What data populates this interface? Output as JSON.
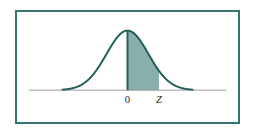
{
  "figure": {
    "name": "standard-normal-distribution-diagram",
    "border_color": "#357470",
    "background_color": "#ffffff"
  },
  "chart_data": {
    "type": "area",
    "title": "",
    "subtitle": "",
    "xlabel": "",
    "ylabel": "",
    "grid": false,
    "legend": null,
    "legend_position": "none",
    "distribution": "standard normal",
    "mean": 0,
    "std_dev": 1,
    "xlim": [
      -4,
      4
    ],
    "ylim": [
      0,
      0.42
    ],
    "curve_color": "#1f5f59",
    "curve_width": 2,
    "fill_color": "#8aaeab",
    "axis_color": "#9a9a9a",
    "shaded_region": {
      "from": 0,
      "to": 1.5,
      "from_label": "0",
      "to_label": "Z",
      "fill": "#8aaeab"
    },
    "tick_labels": [
      {
        "label": "0",
        "x": 0,
        "italic": false
      },
      {
        "label": "Z",
        "x": 1.5,
        "italic": true
      }
    ],
    "x": [
      -4,
      -3.75,
      -3.5,
      -3.25,
      -3,
      -2.75,
      -2.5,
      -2.25,
      -2,
      -1.75,
      -1.5,
      -1.25,
      -1,
      -0.75,
      -0.5,
      -0.25,
      0,
      0.25,
      0.5,
      0.75,
      1,
      1.25,
      1.5,
      1.75,
      2,
      2.25,
      2.5,
      2.75,
      3,
      3.25,
      3.5,
      3.75,
      4
    ],
    "y": [
      0.0001,
      0.0004,
      0.0009,
      0.002,
      0.0044,
      0.0091,
      0.0175,
      0.0317,
      0.054,
      0.0863,
      0.1295,
      0.1826,
      0.242,
      0.3011,
      0.3521,
      0.3867,
      0.3989,
      0.3867,
      0.3521,
      0.3011,
      0.242,
      0.1826,
      0.1295,
      0.0863,
      0.054,
      0.0317,
      0.0175,
      0.0091,
      0.0044,
      0.002,
      0.0009,
      0.0004,
      0.0001
    ]
  }
}
